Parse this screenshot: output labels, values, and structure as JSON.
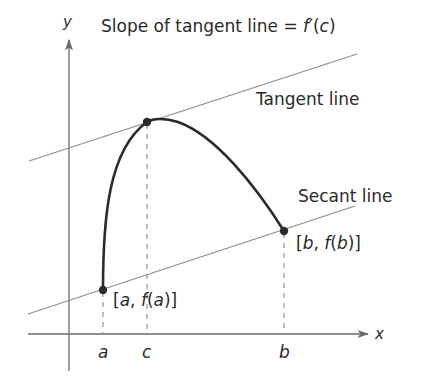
{
  "diagram": {
    "colors": {
      "curve": "#2b2b2b",
      "thin_line": "#8c8c8c",
      "axis": "#6b6b6b",
      "text": "#2a2a2a",
      "point": "#2b2b2b"
    },
    "axes": {
      "x_label": "x",
      "y_label": "y"
    },
    "annotations": {
      "slope_prefix": "Slope of tangent line = ",
      "slope_func": "f′",
      "slope_arg_open": "(",
      "slope_arg": "c",
      "slope_arg_close": ")",
      "tangent_label": "Tangent line",
      "secant_label": "Secant line"
    },
    "points": {
      "a": {
        "tick_label": "a",
        "coord_open": "[",
        "coord_var": "a",
        "coord_comma": ", ",
        "coord_func": "f",
        "coord_paren_open": "(",
        "coord_arg": "a",
        "coord_paren_close": ")]"
      },
      "b": {
        "tick_label": "b",
        "coord_open": "[",
        "coord_var": "b",
        "coord_comma": ", ",
        "coord_func": "f",
        "coord_paren_open": "(",
        "coord_arg": "b",
        "coord_paren_close": ")]"
      },
      "c": {
        "tick_label": "c"
      }
    }
  }
}
